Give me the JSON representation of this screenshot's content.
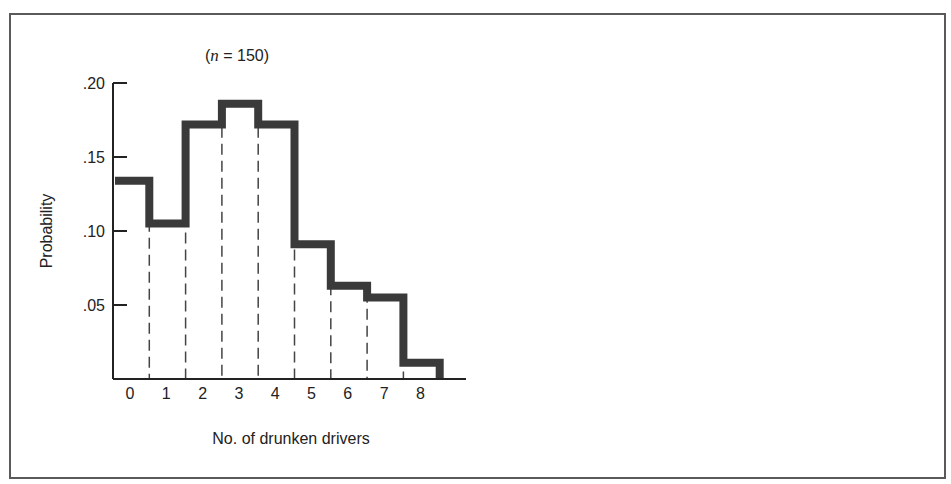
{
  "chart_data": {
    "type": "bar",
    "style": "step-histogram",
    "title": "",
    "annotation": "(n = 150)",
    "annotation_parts": {
      "open": "(",
      "var": "n",
      "rest": " = 150)"
    },
    "xlabel": "No. of drunken drivers",
    "ylabel": "Probability",
    "categories": [
      "0",
      "1",
      "2",
      "3",
      "4",
      "5",
      "6",
      "7",
      "8"
    ],
    "values": [
      0.134,
      0.105,
      0.172,
      0.186,
      0.172,
      0.091,
      0.063,
      0.055,
      0.011
    ],
    "ylim": [
      0,
      0.2
    ],
    "yticks": [
      ".05",
      ".10",
      ".15",
      ".20"
    ],
    "ytick_values": [
      0.05,
      0.1,
      0.15,
      0.2
    ],
    "grid": false,
    "legend": null,
    "line_color": "#3a3a3a",
    "dash_color": "#444444"
  }
}
